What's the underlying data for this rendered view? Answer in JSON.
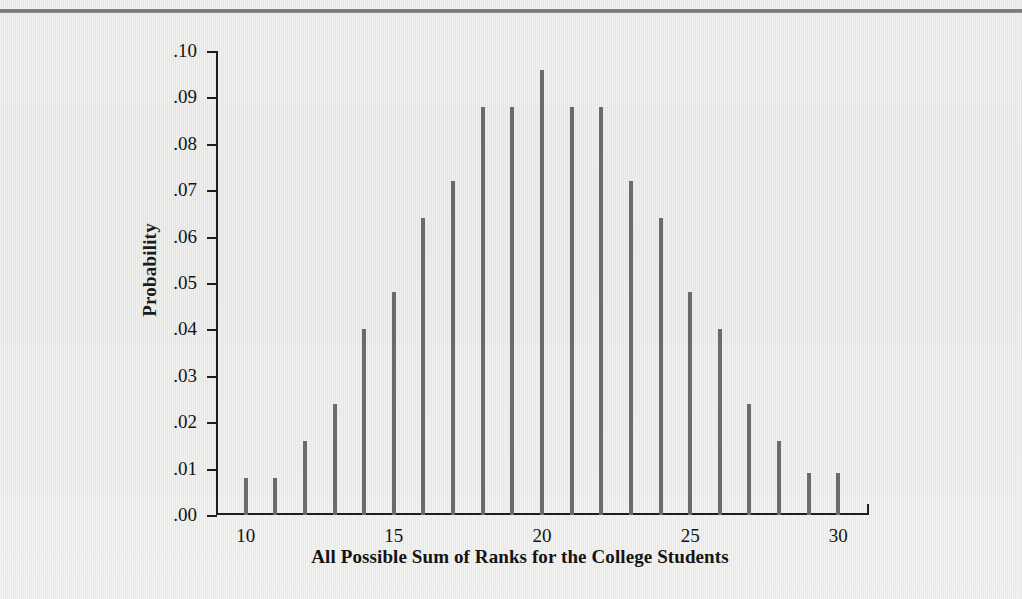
{
  "figure": {
    "background_color": "#e9e9e7",
    "bar_color": "#6b6b6b",
    "axis_color": "#1d1d1d",
    "top_rule_color": "#7a7a7a"
  },
  "chart_data": {
    "type": "bar",
    "title": "",
    "xlabel": "All Possible Sum of Ranks for the College Students",
    "ylabel": "Probability",
    "xlim": [
      9,
      31
    ],
    "ylim": [
      0.0,
      0.1
    ],
    "grid": false,
    "legend": null,
    "x_tick_values": [
      10,
      15,
      20,
      25,
      30
    ],
    "x_tick_labels": [
      "10",
      "15",
      "20",
      "25",
      "30"
    ],
    "x_minor_ticks": [
      9,
      10,
      11,
      12,
      13,
      14,
      15,
      16,
      17,
      18,
      19,
      20,
      21,
      22,
      23,
      24,
      25,
      26,
      27,
      28,
      29,
      30,
      31
    ],
    "y_tick_values": [
      0.0,
      0.01,
      0.02,
      0.03,
      0.04,
      0.05,
      0.06,
      0.07,
      0.08,
      0.09,
      0.1
    ],
    "y_tick_labels": [
      ".00",
      ".01",
      ".02",
      ".03",
      ".04",
      ".05",
      ".06",
      ".07",
      ".08",
      ".09",
      ".10"
    ],
    "categories": [
      10,
      11,
      12,
      13,
      14,
      15,
      16,
      17,
      18,
      19,
      20,
      21,
      22,
      23,
      24,
      25,
      26,
      27,
      28,
      29,
      30
    ],
    "values": [
      0.008,
      0.008,
      0.016,
      0.024,
      0.04,
      0.048,
      0.064,
      0.072,
      0.088,
      0.088,
      0.096,
      0.088,
      0.088,
      0.072,
      0.064,
      0.048,
      0.04,
      0.024,
      0.016,
      0.009,
      0.009
    ]
  }
}
